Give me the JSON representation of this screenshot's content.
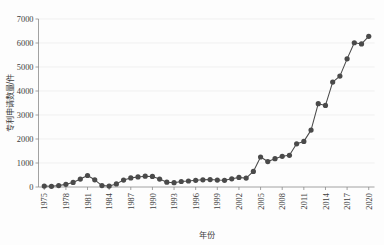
{
  "chart_data": {
    "type": "line",
    "title": "",
    "xlabel": "年份",
    "ylabel": "专利申请数量/件",
    "xlim": [
      1974.2,
      2020.8
    ],
    "ylim": [
      0,
      7000
    ],
    "ytick_values": [
      0,
      1000,
      2000,
      3000,
      4000,
      5000,
      6000,
      7000
    ],
    "ytick_labels": [
      "0",
      "1000",
      "2000",
      "3000",
      "4000",
      "5000",
      "6000",
      "7000"
    ],
    "xtick_values": [
      1975,
      1978,
      1981,
      1984,
      1987,
      1990,
      1993,
      1996,
      1999,
      2002,
      2005,
      2008,
      2011,
      2014,
      2017,
      2020
    ],
    "xtick_labels": [
      "1975",
      "1978",
      "1981",
      "1984",
      "1987",
      "1990",
      "1993",
      "1996",
      "1999",
      "2002",
      "2005",
      "2008",
      "2011",
      "2014",
      "2017",
      "2020"
    ],
    "xtick_rotation": 90,
    "grid": "horizontal",
    "legend": "none",
    "marker": "filled-circle",
    "marker_color": "#4a4a4a",
    "line_color": "#4a4a4a",
    "background_color": "#fdfdfd",
    "grid_color": "#e9e9e9",
    "axis_color": "#8a8a8a",
    "x": [
      1975,
      1976,
      1977,
      1978,
      1979,
      1980,
      1981,
      1982,
      1983,
      1984,
      1985,
      1986,
      1987,
      1988,
      1989,
      1990,
      1991,
      1992,
      1993,
      1994,
      1995,
      1996,
      1997,
      1998,
      1999,
      2000,
      2001,
      2002,
      2003,
      2004,
      2005,
      2006,
      2007,
      2008,
      2009,
      2010,
      2011,
      2012,
      2013,
      2014,
      2015,
      2016,
      2017,
      2018,
      2019,
      2020
    ],
    "y": [
      40,
      30,
      60,
      110,
      190,
      330,
      480,
      300,
      60,
      40,
      130,
      290,
      380,
      420,
      450,
      440,
      330,
      200,
      180,
      230,
      250,
      280,
      300,
      310,
      290,
      280,
      340,
      400,
      370,
      650,
      1250,
      1060,
      1180,
      1280,
      1320,
      1800,
      1900,
      2370,
      3470,
      3400,
      4370,
      4620,
      5340,
      6010,
      5960,
      6280,
      4140,
      2520
    ],
    "series": [
      {
        "name": "专利申请数量",
        "points": [
          {
            "year": 1975,
            "value": 40
          },
          {
            "year": 1976,
            "value": 30
          },
          {
            "year": 1977,
            "value": 60
          },
          {
            "year": 1978,
            "value": 110
          },
          {
            "year": 1979,
            "value": 190
          },
          {
            "year": 1980,
            "value": 330
          },
          {
            "year": 1981,
            "value": 480
          },
          {
            "year": 1982,
            "value": 300
          },
          {
            "year": 1983,
            "value": 60
          },
          {
            "year": 1984,
            "value": 40
          },
          {
            "year": 1985,
            "value": 130
          },
          {
            "year": 1986,
            "value": 290
          },
          {
            "year": 1987,
            "value": 380
          },
          {
            "year": 1988,
            "value": 420
          },
          {
            "year": 1989,
            "value": 450
          },
          {
            "year": 1990,
            "value": 440
          },
          {
            "year": 1991,
            "value": 330
          },
          {
            "year": 1992,
            "value": 200
          },
          {
            "year": 1993,
            "value": 180
          },
          {
            "year": 1994,
            "value": 230
          },
          {
            "year": 1995,
            "value": 250
          },
          {
            "year": 1996,
            "value": 280
          },
          {
            "year": 1997,
            "value": 300
          },
          {
            "year": 1998,
            "value": 310
          },
          {
            "year": 1999,
            "value": 290
          },
          {
            "year": 2000,
            "value": 280
          },
          {
            "year": 2001,
            "value": 340
          },
          {
            "year": 2002,
            "value": 400
          },
          {
            "year": 2003,
            "value": 370
          },
          {
            "year": 2004,
            "value": 650
          },
          {
            "year": 2005,
            "value": 1250
          },
          {
            "year": 2006,
            "value": 1060
          },
          {
            "year": 2007,
            "value": 1180
          },
          {
            "year": 2008,
            "value": 1280
          },
          {
            "year": 2009,
            "value": 1320
          },
          {
            "year": 2010,
            "value": 1800
          },
          {
            "year": 2011,
            "value": 1900
          },
          {
            "year": 2012,
            "value": 2370
          },
          {
            "year": 2013,
            "value": 3470
          },
          {
            "year": 2014,
            "value": 3400
          },
          {
            "year": 2015,
            "value": 4370
          },
          {
            "year": 2016,
            "value": 4620
          },
          {
            "year": 2017,
            "value": 5340
          },
          {
            "year": 2018,
            "value": 6010
          },
          {
            "year": 2019,
            "value": 5960
          },
          {
            "year": 2020,
            "value": 6280
          }
        ]
      }
    ]
  }
}
